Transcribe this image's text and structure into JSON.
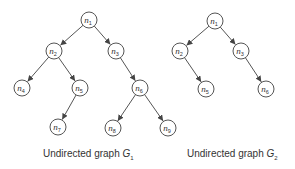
{
  "colors": {
    "stroke": "#555555",
    "text": "#333333",
    "background": "#ffffff"
  },
  "graphs": [
    {
      "id": "G1",
      "caption": {
        "prefix": "Undirected graph ",
        "symbol": "G",
        "subscript": "1"
      },
      "nodes": [
        {
          "id": "n1",
          "letter": "n",
          "sub": "1",
          "x": 89,
          "y": 20
        },
        {
          "id": "n2",
          "letter": "n",
          "sub": "2",
          "x": 54,
          "y": 51
        },
        {
          "id": "n3",
          "letter": "n",
          "sub": "3",
          "x": 116,
          "y": 51
        },
        {
          "id": "n4",
          "letter": "n",
          "sub": "4",
          "x": 22,
          "y": 88
        },
        {
          "id": "n5",
          "letter": "n",
          "sub": "5",
          "x": 80,
          "y": 88
        },
        {
          "id": "n6",
          "letter": "n",
          "sub": "6",
          "x": 140,
          "y": 88
        },
        {
          "id": "n7",
          "letter": "n",
          "sub": "7",
          "x": 58,
          "y": 127
        },
        {
          "id": "n8",
          "letter": "n",
          "sub": "8",
          "x": 113,
          "y": 128
        },
        {
          "id": "n9",
          "letter": "n",
          "sub": "9",
          "x": 168,
          "y": 128
        }
      ],
      "edges": [
        [
          "n1",
          "n2"
        ],
        [
          "n1",
          "n3"
        ],
        [
          "n2",
          "n4"
        ],
        [
          "n2",
          "n5"
        ],
        [
          "n3",
          "n6"
        ],
        [
          "n5",
          "n7"
        ],
        [
          "n6",
          "n8"
        ],
        [
          "n6",
          "n9"
        ]
      ]
    },
    {
      "id": "G2",
      "caption": {
        "prefix": "Undirected graph ",
        "symbol": "G",
        "subscript": "2"
      },
      "nodes": [
        {
          "id": "n1",
          "letter": "n",
          "sub": "1",
          "x": 215,
          "y": 21
        },
        {
          "id": "n2",
          "letter": "n",
          "sub": "2",
          "x": 180,
          "y": 51
        },
        {
          "id": "n3",
          "letter": "n",
          "sub": "3",
          "x": 241,
          "y": 51
        },
        {
          "id": "n5",
          "letter": "n",
          "sub": "5",
          "x": 206,
          "y": 89
        },
        {
          "id": "n6",
          "letter": "n",
          "sub": "6",
          "x": 266,
          "y": 89
        }
      ],
      "edges": [
        [
          "n1",
          "n2"
        ],
        [
          "n1",
          "n3"
        ],
        [
          "n2",
          "n5"
        ],
        [
          "n3",
          "n6"
        ]
      ]
    }
  ]
}
